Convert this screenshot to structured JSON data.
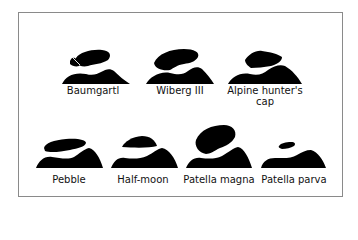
{
  "figure": {
    "colors": {
      "shape": "#000000",
      "frame": "#8a8a8a",
      "background": "#ffffff"
    },
    "row1": [
      {
        "id": "baumgartl",
        "label": "Baumgartl"
      },
      {
        "id": "wiberg-iii",
        "label": "Wiberg III"
      },
      {
        "id": "alpine-hunters-cap",
        "label": "Alpine hunter's",
        "label2": "cap"
      }
    ],
    "row2": [
      {
        "id": "pebble",
        "label": "Pebble"
      },
      {
        "id": "half-moon",
        "label": "Half-moon"
      },
      {
        "id": "patella-magna",
        "label": "Patella magna"
      },
      {
        "id": "patella-parva",
        "label": "Patella parva"
      }
    ]
  }
}
